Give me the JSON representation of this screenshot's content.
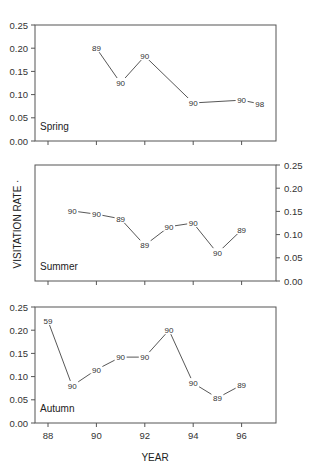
{
  "chart_data": {
    "type": "line",
    "title": "",
    "xlabel": "YEAR",
    "ylabel": "VISITATION RATE",
    "ylabel_suffix": "·",
    "x_ticks": [
      88,
      90,
      92,
      94,
      96
    ],
    "x_tick_labels": [
      "88",
      "90",
      "92",
      "94",
      "96"
    ],
    "xlim": [
      88,
      97.5
    ],
    "y_ticks": [
      0.0,
      0.05,
      0.1,
      0.15,
      0.2,
      0.25
    ],
    "y_tick_labels": [
      "0.00",
      "0.05",
      "0.10",
      "0.15",
      "0.20",
      "0.25"
    ],
    "ylim": [
      0,
      0.25
    ],
    "grid": false,
    "panels": [
      {
        "name": "Spring",
        "y_axis_side": "left",
        "x": [
          90,
          91,
          92,
          94,
          96,
          96.75
        ],
        "values": [
          0.2,
          0.125,
          0.183,
          0.082,
          0.088,
          0.08
        ],
        "point_labels": [
          "89",
          "90",
          "90",
          "90",
          "90",
          "98"
        ]
      },
      {
        "name": "Summer",
        "y_axis_side": "right",
        "x": [
          89,
          90,
          91,
          92,
          93,
          94,
          95,
          96
        ],
        "values": [
          0.151,
          0.144,
          0.134,
          0.077,
          0.117,
          0.125,
          0.06,
          0.11
        ],
        "point_labels": [
          "90",
          "90",
          "89",
          "89",
          "90",
          "90",
          "90",
          "89"
        ]
      },
      {
        "name": "Autumn",
        "y_axis_side": "left",
        "x": [
          88,
          89,
          90,
          91,
          92,
          93,
          94,
          95,
          96
        ],
        "values": [
          0.22,
          0.08,
          0.115,
          0.142,
          0.142,
          0.2,
          0.086,
          0.054,
          0.082
        ],
        "point_labels": [
          "59",
          "90",
          "90",
          "90",
          "90",
          "90",
          "90",
          "89",
          "89"
        ]
      }
    ]
  }
}
